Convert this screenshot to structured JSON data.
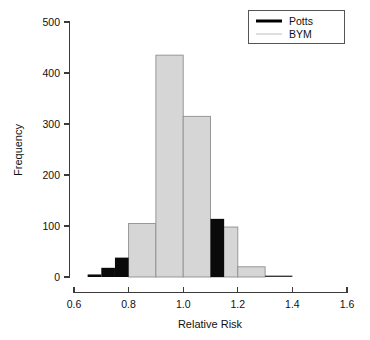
{
  "chart_data": {
    "type": "bar",
    "title": "",
    "xlabel": "Relative Risk",
    "ylabel": "Frequency",
    "xlim": [
      0.6,
      1.6
    ],
    "ylim": [
      0,
      500
    ],
    "xticks": [
      "0.6",
      "0.8",
      "1.0",
      "1.2",
      "1.4",
      "1.6"
    ],
    "xtick_values": [
      0.6,
      0.8,
      1.0,
      1.2,
      1.4,
      1.6
    ],
    "yticks": [
      "0",
      "100",
      "200",
      "300",
      "400",
      "500"
    ],
    "ytick_values": [
      0,
      100,
      200,
      300,
      400,
      500
    ],
    "grid": false,
    "legend_position": "top-right",
    "series": [
      {
        "name": "Potts",
        "color": "#000000",
        "style": "step-histogram-filled",
        "bins": [
          {
            "x0": 0.65,
            "x1": 0.7,
            "value": 5
          },
          {
            "x0": 0.7,
            "x1": 0.75,
            "value": 18
          },
          {
            "x0": 0.75,
            "x1": 0.8,
            "value": 38
          },
          {
            "x0": 1.1,
            "x1": 0.0,
            "value": 0
          }
        ],
        "bins_note": "",
        "values": [
          5,
          18,
          38,
          114,
          2
        ]
      },
      {
        "name": "BYM",
        "color": "#d4d4d4",
        "style": "filled-histogram",
        "bins": [
          {
            "x0": 0.8,
            "x1": 0.9,
            "value": 105
          },
          {
            "x0": 0.9,
            "x1": 1.0,
            "value": 435
          },
          {
            "x0": 1.0,
            "x1": 1.1,
            "value": 315
          },
          {
            "x0": 1.1,
            "x1": 1.2,
            "value": 98
          },
          {
            "x0": 1.2,
            "x1": 1.3,
            "value": 20
          }
        ],
        "values": [
          105,
          435,
          315,
          98,
          20
        ]
      }
    ],
    "potts_bins": [
      {
        "x0": 0.65,
        "x1": 0.7,
        "value": 5
      },
      {
        "x0": 0.7,
        "x1": 0.75,
        "value": 18
      },
      {
        "x0": 0.75,
        "x1": 0.8,
        "value": 38
      },
      {
        "x0": 1.1,
        "x1": 1.15,
        "value": 114
      },
      {
        "x0": 1.3,
        "x1": 1.4,
        "value": 2
      }
    ],
    "bym_bins": [
      {
        "x0": 0.8,
        "x1": 0.9,
        "value": 105
      },
      {
        "x0": 0.9,
        "x1": 1.0,
        "value": 435
      },
      {
        "x0": 1.0,
        "x1": 1.1,
        "value": 315
      },
      {
        "x0": 1.1,
        "x1": 1.2,
        "value": 98
      },
      {
        "x0": 1.2,
        "x1": 1.3,
        "value": 20
      }
    ]
  },
  "legend": {
    "entries": [
      {
        "label": "Potts",
        "color": "#000000",
        "thickness": "thick"
      },
      {
        "label": "BYM",
        "color": "#d0d0d0",
        "thickness": "thin"
      }
    ]
  },
  "colors": {
    "potts": "#000000",
    "bym_fill": "#d4d4d4",
    "bym_edge": "#8a8a8a",
    "axis": "#3b3b3b",
    "background": "#ffffff"
  }
}
